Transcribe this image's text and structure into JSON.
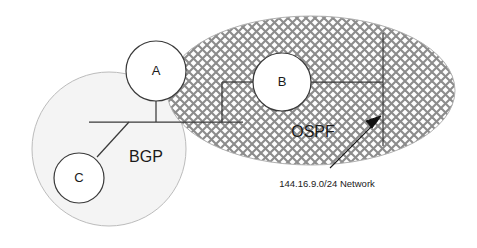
{
  "diagram": {
    "type": "network-topology-diagram",
    "canvas": {
      "width": 477,
      "height": 248,
      "background": "#ffffff"
    },
    "domains": [
      {
        "id": "bgp",
        "label": "BGP",
        "shape": "circle",
        "fill": "#f4f4f4",
        "stroke": "#b9b9b9",
        "label_position": "inner-right"
      },
      {
        "id": "ospf",
        "label": "OSPF",
        "shape": "ellipse",
        "fill": "crosshatch",
        "pattern_color": "#8c8c8c",
        "stroke": "#b0b0b0",
        "label_position": "inner-lower-left"
      }
    ],
    "nodes": [
      {
        "id": "a",
        "label": "A",
        "domain": "bgp-ospf-border",
        "fill": "#ffffff",
        "stroke": "#3a3a3a"
      },
      {
        "id": "b",
        "label": "B",
        "domain": "ospf",
        "fill": "#ffffff",
        "stroke": "#3a3a3a"
      },
      {
        "id": "c",
        "label": "C",
        "domain": "bgp",
        "fill": "#ffffff",
        "stroke": "#3a3a3a"
      }
    ],
    "links": [
      {
        "from": "a",
        "to": "bus",
        "style": "solid"
      },
      {
        "from": "c",
        "to": "bus",
        "style": "solid"
      },
      {
        "from": "bus",
        "to": "b",
        "style": "solid-stepped"
      },
      {
        "from": "b",
        "to": "network-144",
        "style": "solid"
      }
    ],
    "annotations": [
      {
        "id": "network-144",
        "label": "144.16.9.0/24 Network",
        "pointer": "arrow",
        "target": "ospf-vertical-segment"
      }
    ],
    "colors": {
      "line": "#3a3a3a",
      "text": "#1a1a1a",
      "bgp_fill": "#f4f4f4",
      "bgp_stroke": "#b9b9b9",
      "ospf_stroke": "#b0b0b0",
      "hatch": "#8c8c8c"
    }
  }
}
